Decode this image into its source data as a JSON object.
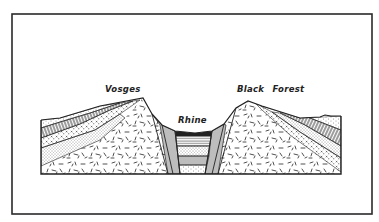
{
  "figure": {
    "type": "geological-cross-section",
    "labels": {
      "left_massif": "Vosges",
      "valley": "Rhine",
      "right_massif": "Black Forest"
    },
    "colors": {
      "ink": "#222222",
      "paper": "#ffffff"
    }
  }
}
